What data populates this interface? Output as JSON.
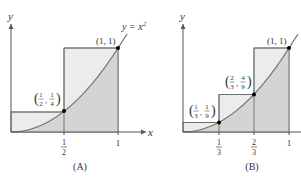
{
  "colors": {
    "upper_rect_fill": "#ececec",
    "under_curve_fill": "#d4d4d4",
    "line": "#6e6e6e",
    "axis": "#555555",
    "point": "#000000"
  },
  "panel_a": {
    "caption": "(A)",
    "y_axis_label": "y",
    "x_axis_label": "x",
    "curve_label": "y = x²",
    "curve_label_base": "y = x",
    "curve_label_exp": "2",
    "x_ticks": [
      {
        "num": "1",
        "den": "2"
      },
      {
        "label": "1"
      }
    ],
    "points": [
      {
        "label_num1": "1",
        "label_den1": "2",
        "label_num2": "1",
        "label_den2": "4",
        "x": 0.5,
        "y": 0.25
      },
      {
        "label": "(1, 1)",
        "x": 1,
        "y": 1
      }
    ],
    "rectangles": [
      {
        "x0": 0,
        "x1": 0.5,
        "height": 0.25
      },
      {
        "x0": 0.5,
        "x1": 1,
        "height": 1
      }
    ]
  },
  "panel_b": {
    "caption": "(B)",
    "y_axis_label": "y",
    "x_ticks": [
      {
        "num": "1",
        "den": "3"
      },
      {
        "num": "2",
        "den": "3"
      },
      {
        "label": "1"
      }
    ],
    "points": [
      {
        "label_num1": "1",
        "label_den1": "3",
        "label_num2": "1",
        "label_den2": "9",
        "x": 0.3333,
        "y": 0.1111
      },
      {
        "label_num1": "2",
        "label_den1": "3",
        "label_num2": "4",
        "label_den2": "9",
        "x": 0.6667,
        "y": 0.4444
      },
      {
        "label": "(1, 1)",
        "x": 1,
        "y": 1
      }
    ],
    "rectangles": [
      {
        "x0": 0,
        "x1": 0.3333,
        "height": 0.1111
      },
      {
        "x0": 0.3333,
        "x1": 0.6667,
        "height": 0.4444
      },
      {
        "x0": 0.6667,
        "x1": 1,
        "height": 1
      }
    ]
  }
}
